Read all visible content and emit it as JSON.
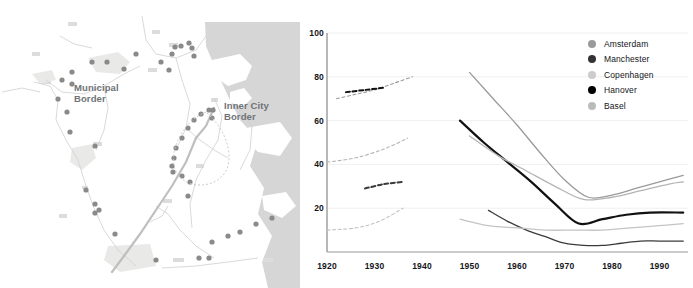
{
  "map": {
    "name": "city-map",
    "labels": [
      {
        "id": "municipal",
        "text": "Municipal\nBorder"
      },
      {
        "id": "innercity",
        "text": "Inner City\nBorder"
      }
    ],
    "colors": {
      "water": "#d6d6d6",
      "land": "#ffffff",
      "road": "#c9c9c9",
      "dot": "#8a8a8a",
      "label_text": "#6f7276",
      "building": "#dcdcdc"
    }
  },
  "chart_data": {
    "type": "line",
    "title": "",
    "xlabel": "",
    "ylabel": "",
    "xlim": [
      1920,
      1996
    ],
    "ylim": [
      0,
      100
    ],
    "grid": true,
    "legend_position": "top-right",
    "yticks": [
      100,
      80,
      60,
      40,
      20
    ],
    "xticks": [
      1920,
      1930,
      1940,
      1950,
      1960,
      1970,
      1980,
      1990
    ],
    "series": [
      {
        "name": "Amsterdam",
        "color": "#9a9a9a",
        "legend_dot": "#9a9a9a",
        "historic": {
          "style": "dashed",
          "x": [
            1922,
            1926,
            1930,
            1934,
            1938
          ],
          "y": [
            70,
            72,
            74,
            77,
            80
          ]
        },
        "modern": {
          "style": "solid",
          "x": [
            1950,
            1955,
            1960,
            1965,
            1970,
            1975,
            1980,
            1985,
            1990,
            1995
          ],
          "y": [
            82,
            70,
            58,
            45,
            33,
            25,
            26,
            29,
            32,
            35
          ]
        }
      },
      {
        "name": "Manchester",
        "color": "#3b3b3b",
        "legend_dot": "#333333",
        "historic": {
          "style": "dashed",
          "x": [
            1928,
            1932,
            1936
          ],
          "y": [
            29,
            31,
            32
          ]
        },
        "modern": {
          "style": "solid",
          "x": [
            1954,
            1958,
            1962,
            1966,
            1970,
            1974,
            1978,
            1982,
            1986,
            1990,
            1995
          ],
          "y": [
            19,
            14,
            10,
            7,
            4,
            3,
            3,
            4,
            5,
            5,
            5
          ]
        }
      },
      {
        "name": "Copenhagen",
        "color": "#c4c4c4",
        "legend_dot": "#cccccc",
        "historic": {
          "style": "dashed",
          "x": [
            1920,
            1926,
            1931,
            1936
          ],
          "y": [
            10,
            11,
            14,
            20
          ]
        },
        "modern": {
          "style": "solid",
          "x": [
            1948,
            1954,
            1960,
            1966,
            1972,
            1978,
            1984,
            1990,
            1995
          ],
          "y": [
            15,
            12,
            11,
            10,
            10,
            10,
            11,
            12,
            13
          ]
        }
      },
      {
        "name": "Hanover",
        "color": "#111111",
        "legend_dot": "#000000",
        "historic": {
          "style": "dashed",
          "x": [
            1924,
            1928,
            1932
          ],
          "y": [
            73,
            74,
            75
          ]
        },
        "modern": {
          "style": "solid",
          "x": [
            1948,
            1953,
            1958,
            1963,
            1968,
            1973,
            1978,
            1983,
            1988,
            1995
          ],
          "y": [
            60,
            50,
            41,
            32,
            22,
            13,
            15,
            17,
            18,
            18
          ]
        }
      },
      {
        "name": "Basel",
        "color": "#b4b4b4",
        "legend_dot": "#bbbbbb",
        "historic": {
          "style": "dashed",
          "x": [
            1920,
            1926,
            1932,
            1937
          ],
          "y": [
            41,
            43,
            47,
            52
          ]
        },
        "modern": {
          "style": "solid",
          "x": [
            1950,
            1956,
            1962,
            1968,
            1974,
            1980,
            1986,
            1992,
            1995
          ],
          "y": [
            53,
            44,
            37,
            30,
            24,
            25,
            28,
            31,
            32
          ]
        }
      }
    ],
    "legend": [
      {
        "label": "Amsterdam",
        "color": "#9a9a9a"
      },
      {
        "label": "Manchester",
        "color": "#333333"
      },
      {
        "label": "Copenhagen",
        "color": "#cccccc"
      },
      {
        "label": "Hanover",
        "color": "#000000"
      },
      {
        "label": "Basel",
        "color": "#bbbbbb"
      }
    ]
  }
}
